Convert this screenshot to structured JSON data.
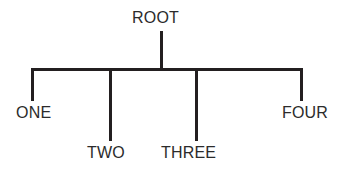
{
  "diagram": {
    "type": "tree-diagram",
    "background_color": "#ffffff",
    "line_color": "#231f20",
    "text_color": "#2b2b2b",
    "root": {
      "label": "ROOT"
    },
    "children": [
      {
        "label": "ONE"
      },
      {
        "label": "TWO"
      },
      {
        "label": "THREE"
      },
      {
        "label": "FOUR"
      }
    ]
  }
}
